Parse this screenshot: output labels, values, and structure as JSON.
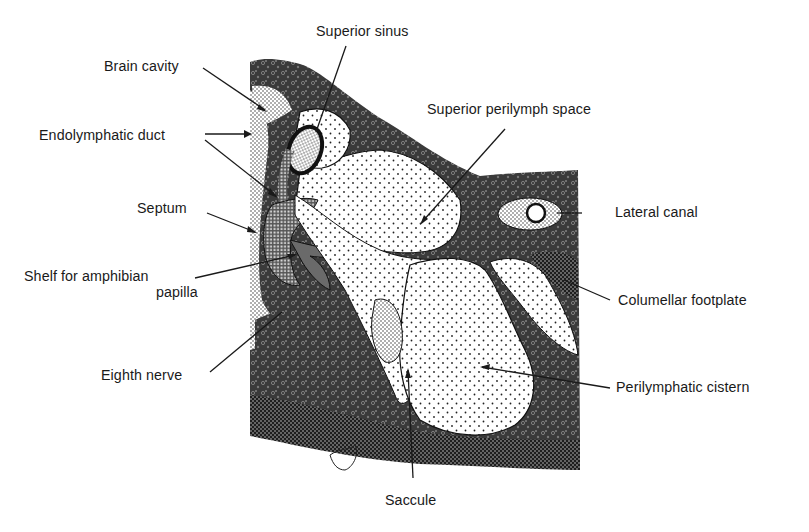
{
  "diagram": {
    "labels": {
      "superior_sinus": "Superior sinus",
      "brain_cavity": "Brain cavity",
      "superior_perilymph_space": "Superior perilymph space",
      "endolymphatic_duct": "Endolymphatic duct",
      "lateral_canal": "Lateral canal",
      "septum": "Septum",
      "shelf_line1": "Shelf for amphibian",
      "shelf_line2": "papilla",
      "columellar_footplate": "Columellar footplate",
      "eighth_nerve": "Eighth nerve",
      "perilymphatic_cistern": "Perilymphatic cistern",
      "saccule": "Saccule"
    },
    "colors": {
      "ink": "#1a1a1a",
      "background": "#ffffff",
      "dark_tissue": "#2b2b2b",
      "mid_tissue": "#5a5a5a",
      "light_space": "#f4f4f4"
    }
  }
}
